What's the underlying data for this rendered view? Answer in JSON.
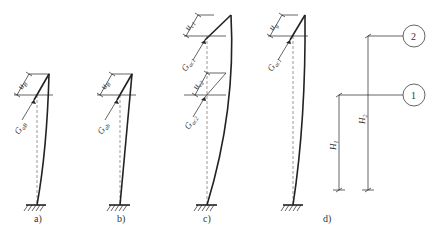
{
  "figure": {
    "panels": [
      {
        "id": "a",
        "caption": "a)",
        "labels": {
          "displacement": "u",
          "displacement_sub": "B",
          "force": "G",
          "force_sub": "aB"
        }
      },
      {
        "id": "b",
        "caption": "b)",
        "labels": {
          "displacement": "u",
          "displacement_sub": "B",
          "force": "G",
          "force_sub": "ab"
        }
      },
      {
        "id": "c",
        "caption": "c)",
        "labels": {
          "displacement1": "u",
          "displacement1_sub": "c1",
          "force1": "G",
          "force1_sub": "ac1",
          "displacement2": "u",
          "displacement2_sub": "c2",
          "force2": "G",
          "force2_sub": "ac2"
        }
      },
      {
        "id": "d",
        "caption": "d)",
        "labels": {
          "displacement": "u",
          "displacement_sub": "g",
          "force": "G",
          "force_sub": "ac1"
        }
      }
    ],
    "levels": {
      "level1": {
        "marker": "1",
        "height_label": "H",
        "height_sub": "1"
      },
      "level2": {
        "marker": "2",
        "height_label": "H",
        "height_sub": "2"
      }
    }
  }
}
